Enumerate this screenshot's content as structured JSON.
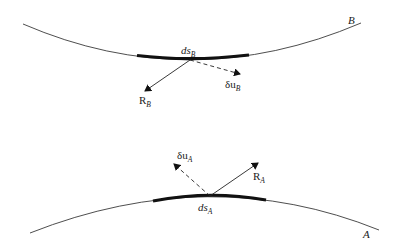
{
  "diagram": {
    "type": "contact-mechanics-virtual-work",
    "colors": {
      "background": "#ffffff",
      "line": "#3a3a3a",
      "contact_segment": "#111111",
      "text": "#222222"
    },
    "body_B": {
      "name": "B",
      "element_label": {
        "main": "ds",
        "sub": "B"
      },
      "reaction_label": {
        "main": "R",
        "sub": "B"
      },
      "displacement_label": {
        "main": "δu",
        "sub": "B"
      }
    },
    "body_A": {
      "name": "A",
      "element_label": {
        "main": "ds",
        "sub": "A"
      },
      "reaction_label": {
        "main": "R",
        "sub": "A"
      },
      "displacement_label": {
        "main": "δu",
        "sub": "A"
      }
    }
  }
}
